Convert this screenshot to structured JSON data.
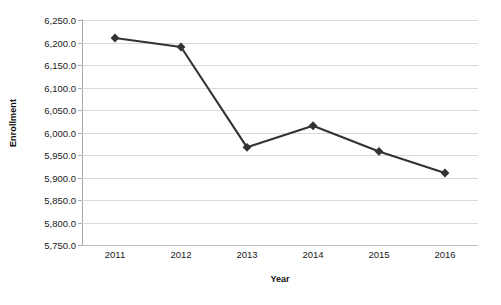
{
  "chart_data": {
    "type": "line",
    "title": "",
    "xlabel": "Year",
    "ylabel": "Enrollment",
    "categories": [
      "2011",
      "2012",
      "2013",
      "2014",
      "2015",
      "2016"
    ],
    "values": [
      6210,
      6190,
      5967,
      6015,
      5958,
      5910
    ],
    "series": [
      {
        "name": "Enrollment",
        "values": [
          6210,
          6190,
          5967,
          6015,
          5958,
          5910
        ]
      }
    ],
    "ylim": [
      5750,
      6250
    ],
    "ytick_step": 50,
    "ytick_labels": [
      "6,250.0",
      "6,200.0",
      "6,150.0",
      "6,100.0",
      "6,050.0",
      "6,000.0",
      "5,950.0",
      "5,900.0",
      "5,850.0",
      "5,800.0",
      "5,750.0"
    ],
    "ytick_values": [
      6250,
      6200,
      6150,
      6100,
      6050,
      6000,
      5950,
      5900,
      5850,
      5800,
      5750
    ],
    "grid": true,
    "grid_axis": "y",
    "legend": false,
    "legend_position": "none",
    "marker": "diamond",
    "colors": {
      "line": "#333333",
      "marker": "#333333",
      "gridline": "#d9d9d9",
      "axis": "#a6a6a6",
      "text": "#1a1a1a",
      "background": "#ffffff"
    }
  }
}
